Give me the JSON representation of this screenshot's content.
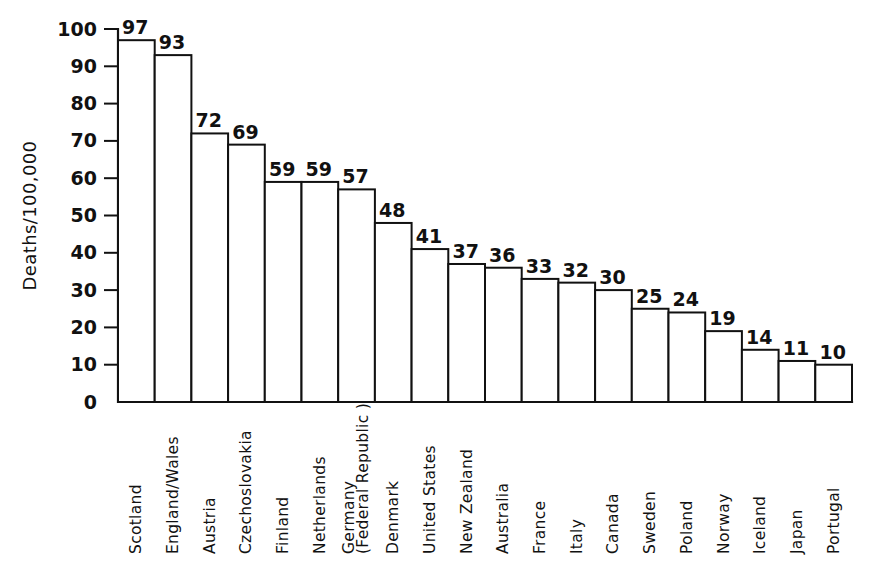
{
  "chart_data": {
    "type": "bar",
    "title": "",
    "subtitle": "",
    "xlabel": "",
    "ylabel": "Deaths/100,000",
    "ylim": [
      0,
      100
    ],
    "ytick_step": 10,
    "yticks": [
      0,
      10,
      20,
      30,
      40,
      50,
      60,
      70,
      80,
      90,
      100
    ],
    "ytick_labels": [
      "0",
      "10",
      "20",
      "30",
      "40",
      "50",
      "60",
      "70",
      "80",
      "90",
      "100"
    ],
    "grid": false,
    "legend": null,
    "legend_position": "none",
    "bar_style": {
      "fill": "#ffffff",
      "edge": "#111111",
      "adjacent": true
    },
    "value_labels_shown": true,
    "categories": [
      "Scotland",
      "England/Wales",
      "Austria",
      "Czechoslovakia",
      "Finland",
      "Netherlands",
      "Germany\n(Federal Republic )",
      "Denmark",
      "United States",
      "New Zealand",
      "Australia",
      "France",
      "Italy",
      "Canada",
      "Sweden",
      "Poland",
      "Norway",
      "Iceland",
      "Japan",
      "Portugal"
    ],
    "category_lines": [
      [
        "Scotland"
      ],
      [
        "England/Wales"
      ],
      [
        "Austria"
      ],
      [
        "Czechoslovakia"
      ],
      [
        "Finland"
      ],
      [
        "Netherlands"
      ],
      [
        "Germany",
        "(Federal Republic )"
      ],
      [
        "Denmark"
      ],
      [
        "United States"
      ],
      [
        "New Zealand"
      ],
      [
        "Australia"
      ],
      [
        "France"
      ],
      [
        "Italy"
      ],
      [
        "Canada"
      ],
      [
        "Sweden"
      ],
      [
        "Poland"
      ],
      [
        "Norway"
      ],
      [
        "Iceland"
      ],
      [
        "Japan"
      ],
      [
        "Portugal"
      ]
    ],
    "values": [
      97,
      93,
      72,
      69,
      59,
      59,
      57,
      48,
      41,
      37,
      36,
      33,
      32,
      30,
      25,
      24,
      19,
      14,
      11,
      10
    ],
    "value_labels": [
      "97",
      "93",
      "72",
      "69",
      "59",
      "59",
      "57",
      "48",
      "41",
      "37",
      "36",
      "33",
      "32",
      "30",
      "25",
      "24",
      "19",
      "14",
      "11",
      "10"
    ]
  }
}
